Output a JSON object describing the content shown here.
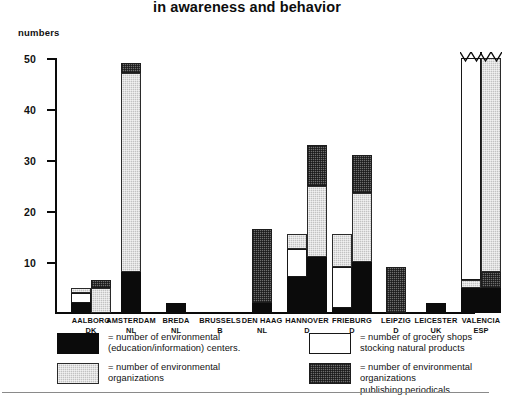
{
  "title": "in awareness and behavior",
  "axis": {
    "ylabel": "numbers",
    "yticks": [
      "10",
      "20",
      "30",
      "40",
      "50"
    ]
  },
  "legend": [
    {
      "key": "centers",
      "swatch": "black",
      "label": "= number of environmental\n   (education/information) centers."
    },
    {
      "key": "shops",
      "swatch": "white",
      "label": "= number of grocery shops\n   stocking natural products"
    },
    {
      "key": "organizations",
      "swatch": "light-gray",
      "label": "= number of environmental\n   organizations"
    },
    {
      "key": "periodicals",
      "swatch": "dark-gray",
      "label": "= number of environmental organizations\n    publishing periodicals"
    }
  ],
  "chart_data": {
    "type": "bar",
    "title": "in awareness and behavior",
    "xlabel": "",
    "ylabel": "numbers",
    "ylim": [
      0,
      50
    ],
    "grid": false,
    "legend_position": "below-plot",
    "stacked": true,
    "note": "Valencia bars are truncated with an axis-break zigzag; their true values exceed 50.",
    "series": [
      {
        "name": "number of environmental (education/information) centers.",
        "fill": "black"
      },
      {
        "name": "number of environmental organizations",
        "fill": "light-gray"
      },
      {
        "name": "number of grocery shops stocking natural products",
        "fill": "white"
      },
      {
        "name": "number of environmental organizations publishing periodicals",
        "fill": "dark-gray"
      }
    ],
    "categories": [
      {
        "city": "AALBORG",
        "country": "DK"
      },
      {
        "city": "AMSTERDAM",
        "country": "NL"
      },
      {
        "city": "BREDA",
        "country": "NL"
      },
      {
        "city": "BRUSSELS",
        "country": "B"
      },
      {
        "city": "DEN HAAG",
        "country": "NL"
      },
      {
        "city": "HANNOVER",
        "country": "D"
      },
      {
        "city": "FRIEBURG",
        "country": "D"
      },
      {
        "city": "LEIPZIG",
        "country": "D"
      },
      {
        "city": "LEICESTER",
        "country": "UK"
      },
      {
        "city": "VALENCIA",
        "country": "ESP"
      }
    ],
    "bars": [
      {
        "category": "AALBORG",
        "bar": 1,
        "segments": [
          {
            "series": "centers",
            "value": 2,
            "fill": "black"
          },
          {
            "series": "shops",
            "value": 2,
            "fill": "white"
          },
          {
            "series": "organizations",
            "value": 1,
            "fill": "light-gray"
          }
        ],
        "total": 5
      },
      {
        "category": "AALBORG",
        "bar": 2,
        "segments": [
          {
            "series": "organizations",
            "value": 5,
            "fill": "light-gray"
          },
          {
            "series": "periodicals",
            "value": 1.5,
            "fill": "dark-gray"
          }
        ],
        "total": 6.5
      },
      {
        "category": "AMSTERDAM",
        "bar": 1,
        "segments": [
          {
            "series": "centers",
            "value": 8,
            "fill": "black"
          },
          {
            "series": "organizations",
            "value": 39,
            "fill": "light-gray"
          },
          {
            "series": "periodicals",
            "value": 2,
            "fill": "dark-gray"
          }
        ],
        "total": 49
      },
      {
        "category": "BREDA",
        "bar": 1,
        "segments": [
          {
            "series": "centers",
            "value": 2,
            "fill": "black"
          }
        ],
        "total": 2
      },
      {
        "category": "BRUSSELS",
        "bar": 1,
        "segments": [],
        "total": 0
      },
      {
        "category": "DEN HAAG",
        "bar": 1,
        "segments": [
          {
            "series": "centers",
            "value": 2,
            "fill": "black"
          },
          {
            "series": "periodicals",
            "value": 14.5,
            "fill": "dark-gray"
          }
        ],
        "total": 16.5
      },
      {
        "category": "HANNOVER",
        "bar": 1,
        "segments": [
          {
            "series": "centers",
            "value": 7,
            "fill": "black"
          },
          {
            "series": "shops",
            "value": 5.5,
            "fill": "white"
          },
          {
            "series": "organizations",
            "value": 3,
            "fill": "light-gray"
          }
        ],
        "total": 15.5
      },
      {
        "category": "HANNOVER",
        "bar": 2,
        "segments": [
          {
            "series": "centers",
            "value": 11,
            "fill": "black"
          },
          {
            "series": "organizations",
            "value": 14,
            "fill": "light-gray"
          },
          {
            "series": "periodicals",
            "value": 8,
            "fill": "dark-gray"
          }
        ],
        "total": 33
      },
      {
        "category": "FRIEBURG",
        "bar": 1,
        "segments": [
          {
            "series": "centers",
            "value": 1,
            "fill": "black"
          },
          {
            "series": "shops",
            "value": 8,
            "fill": "white"
          },
          {
            "series": "organizations",
            "value": 6.5,
            "fill": "light-gray"
          }
        ],
        "total": 15.5
      },
      {
        "category": "FRIEBURG",
        "bar": 2,
        "segments": [
          {
            "series": "centers",
            "value": 10,
            "fill": "black"
          },
          {
            "series": "organizations",
            "value": 13.5,
            "fill": "light-gray"
          },
          {
            "series": "periodicals",
            "value": 7.5,
            "fill": "dark-gray"
          }
        ],
        "total": 31
      },
      {
        "category": "LEIPZIG",
        "bar": 1,
        "segments": [
          {
            "series": "periodicals",
            "value": 9,
            "fill": "dark-gray"
          }
        ],
        "total": 9
      },
      {
        "category": "LEICESTER",
        "bar": 1,
        "segments": [
          {
            "series": "centers",
            "value": 2,
            "fill": "black"
          }
        ],
        "total": 2
      },
      {
        "category": "VALENCIA",
        "bar": 1,
        "truncated": true,
        "segments": [
          {
            "series": "centers",
            "value": 5,
            "fill": "black"
          },
          {
            "series": "organizations",
            "value": 1.5,
            "fill": "light-gray"
          },
          {
            "series": "shops",
            "value": 44.5,
            "fill": "white"
          }
        ],
        "total": 51
      },
      {
        "category": "VALENCIA",
        "bar": 2,
        "truncated": true,
        "segments": [
          {
            "series": "centers",
            "value": 5,
            "fill": "black"
          },
          {
            "series": "periodicals",
            "value": 3,
            "fill": "dark-gray"
          },
          {
            "series": "organizations",
            "value": 43,
            "fill": "light-gray"
          }
        ],
        "total": 51
      }
    ]
  }
}
